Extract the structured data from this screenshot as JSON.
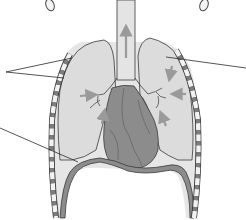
{
  "diagram": {
    "structures": [
      {
        "id": "trachea",
        "label": ""
      },
      {
        "id": "left-lung",
        "label": ""
      },
      {
        "id": "right-lung",
        "label": ""
      },
      {
        "id": "heart",
        "label": ""
      },
      {
        "id": "diaphragm",
        "label": ""
      },
      {
        "id": "rib-cage",
        "label": ""
      },
      {
        "id": "clavicles",
        "label": ""
      }
    ],
    "leader_lines": [
      {
        "id": "leader-left-upper-1",
        "from": [
          10,
          72
        ],
        "to": [
          72,
          58
        ]
      },
      {
        "id": "leader-left-upper-2",
        "from": [
          10,
          72
        ],
        "to": [
          64,
          78
        ]
      },
      {
        "id": "leader-right-lung",
        "from": [
          244,
          68
        ],
        "to": [
          168,
          57
        ]
      },
      {
        "id": "leader-left-diaphragm",
        "from": [
          0,
          128
        ],
        "to": [
          76,
          162
        ]
      }
    ],
    "arrows": [
      {
        "id": "trachea-up-arrow",
        "direction": "up"
      },
      {
        "id": "left-bronchi-arrow",
        "direction": "right"
      },
      {
        "id": "right-bronchi-arrow-1",
        "direction": "down"
      },
      {
        "id": "right-bronchi-arrow-2",
        "direction": "left"
      },
      {
        "id": "left-lower-arrow",
        "direction": "up"
      },
      {
        "id": "right-lower-arrow",
        "direction": "up"
      }
    ],
    "colors": {
      "lung_fill": "#dcdcdc",
      "heart_fill": "#8c8c8c",
      "heart_shade": "#7a7a7a",
      "outline": "#3a3a3a",
      "rib_light": "#f2f2f2",
      "rib_dark": "#7d7d7d",
      "arrow": "#9a9a9a",
      "background": "#ffffff"
    }
  }
}
